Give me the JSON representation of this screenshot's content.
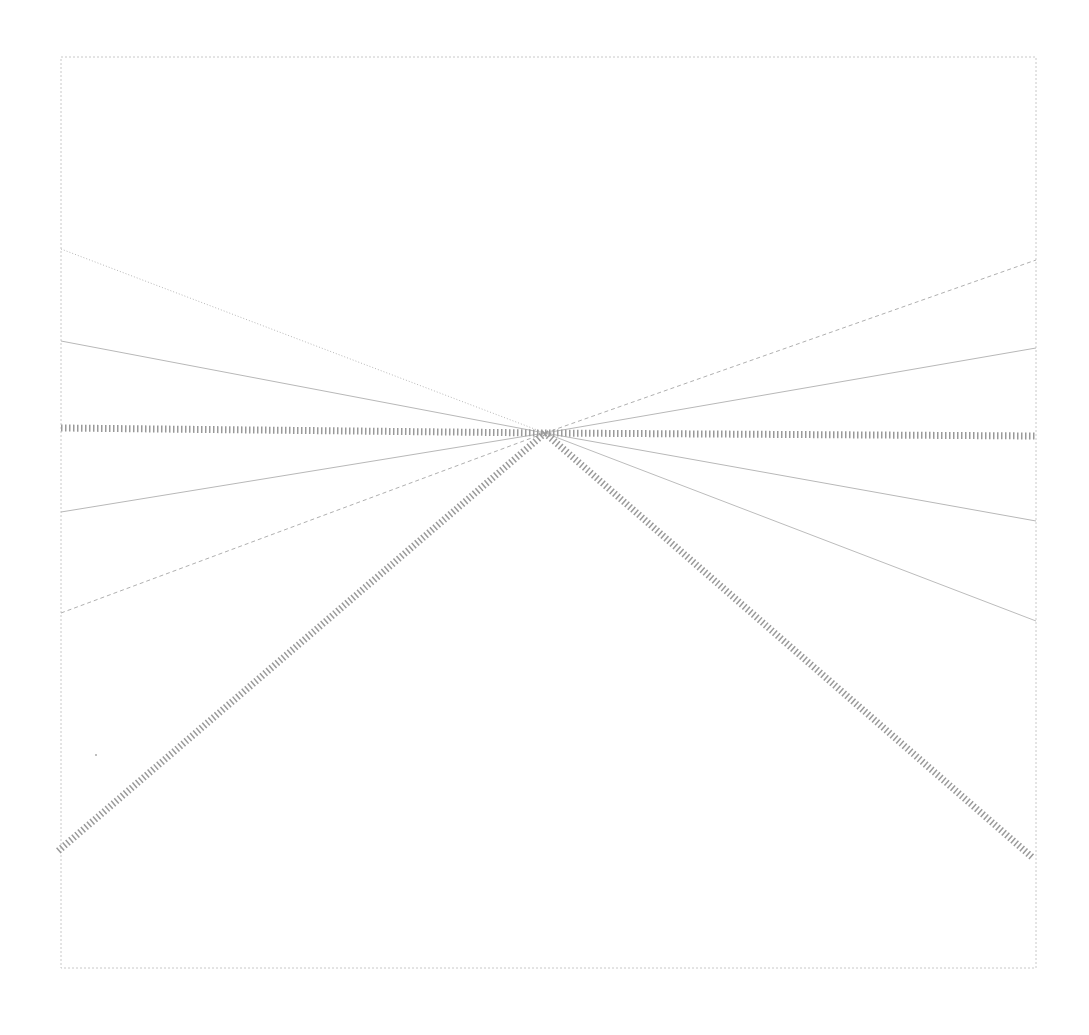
{
  "diagram": {
    "background": "#ffffff",
    "frame": {
      "x1": 61,
      "y1": 57,
      "x2": 1036,
      "y2": 968,
      "stroke": "#c8c8c8",
      "stroke_width": 1,
      "dash": "2 2"
    },
    "center": {
      "x": 545,
      "y": 433
    },
    "lines": [
      {
        "name": "thin-upper-left-steep",
        "from": [
          61,
          249
        ],
        "to": [
          545,
          433
        ],
        "stroke": "#b8b8b8",
        "width": 1,
        "style": "dotted"
      },
      {
        "name": "thin-upper-left-shallow",
        "from": [
          61,
          341
        ],
        "to": [
          545,
          433
        ],
        "stroke": "#b8b8b8",
        "width": 1,
        "style": "solid"
      },
      {
        "name": "thin-lower-left-shallow",
        "from": [
          61,
          512
        ],
        "to": [
          545,
          433
        ],
        "stroke": "#b8b8b8",
        "width": 1,
        "style": "solid"
      },
      {
        "name": "thin-lower-left-steep",
        "from": [
          61,
          613
        ],
        "to": [
          545,
          433
        ],
        "stroke": "#b0b0b0",
        "width": 1,
        "style": "dashed"
      },
      {
        "name": "thin-upper-right-steep",
        "from": [
          545,
          433
        ],
        "to": [
          1036,
          260
        ],
        "stroke": "#b0b0b0",
        "width": 1,
        "style": "dashed"
      },
      {
        "name": "thin-upper-right-shallow",
        "from": [
          545,
          433
        ],
        "to": [
          1036,
          348
        ],
        "stroke": "#b8b8b8",
        "width": 1,
        "style": "solid"
      },
      {
        "name": "thin-lower-right-shallow",
        "from": [
          545,
          433
        ],
        "to": [
          1036,
          521
        ],
        "stroke": "#b8b8b8",
        "width": 1,
        "style": "solid"
      },
      {
        "name": "thin-lower-right-steep",
        "from": [
          545,
          433
        ],
        "to": [
          1036,
          621
        ],
        "stroke": "#bcbcbc",
        "width": 1,
        "style": "solid"
      },
      {
        "name": "thick-horizontal-left",
        "from": [
          61,
          428
        ],
        "to": [
          545,
          433
        ],
        "stroke": "#9a9a9a",
        "width": 7,
        "style": "hatched"
      },
      {
        "name": "thick-horizontal-right",
        "from": [
          545,
          433
        ],
        "to": [
          1036,
          436
        ],
        "stroke": "#9a9a9a",
        "width": 7,
        "style": "hatched"
      },
      {
        "name": "thick-diagonal-lower-left",
        "from": [
          545,
          433
        ],
        "to": [
          57,
          852
        ],
        "stroke": "#9a9a9a",
        "width": 7,
        "style": "hatched"
      },
      {
        "name": "thick-diagonal-lower-right",
        "from": [
          545,
          433
        ],
        "to": [
          1033,
          858
        ],
        "stroke": "#9a9a9a",
        "width": 7,
        "style": "hatched"
      }
    ],
    "specks": [
      {
        "x": 96,
        "y": 755,
        "r": 1
      }
    ]
  }
}
